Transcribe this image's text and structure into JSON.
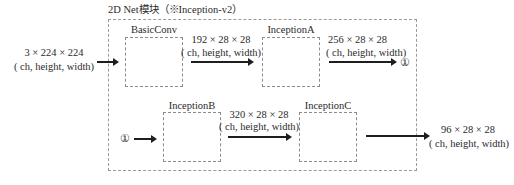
{
  "title": "2D Net模块（※Inception-v2）",
  "input": {
    "shape": "3 × 224 × 224",
    "dims": "( ch, height, width)"
  },
  "blocks": [
    {
      "label": "BasicConv"
    },
    {
      "label": "InceptionA"
    },
    {
      "label": "InceptionB"
    },
    {
      "label": "InceptionC"
    }
  ],
  "edges": [
    {
      "shape": "192 × 28 × 28",
      "dims": "( ch, height, width)"
    },
    {
      "shape": "256 × 28 × 28",
      "dims": "( ch, height, width)"
    },
    {
      "shape": "320 × 28 × 28",
      "dims": "( ch, height, width)"
    }
  ],
  "connector": {
    "symbol": "①"
  },
  "output": {
    "shape": "96 × 28 × 28",
    "dims": "( ch, height, width)"
  }
}
